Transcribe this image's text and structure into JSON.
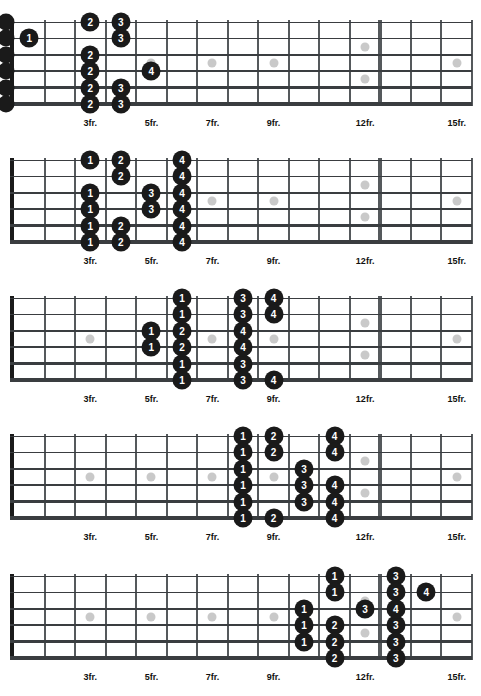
{
  "page": {
    "width": 481,
    "height": 696,
    "background": "#ffffff",
    "dot_color": "#1a1a1a",
    "dot_text_color": "#ffffff",
    "inlay_color": "#c9c9c9",
    "fret_color": "#55595c",
    "string_color": "#3a3d40",
    "nut_color": "#1a1a1a"
  },
  "fretboard": {
    "num_strings": 6,
    "num_frets": 15,
    "string_names_high_to_low": [
      "1",
      "2",
      "3",
      "4",
      "5",
      "6"
    ],
    "fret_marker_labels": [
      {
        "fret": 3,
        "label": "3fr."
      },
      {
        "fret": 5,
        "label": "5fr."
      },
      {
        "fret": 7,
        "label": "7fr."
      },
      {
        "fret": 9,
        "label": "9fr."
      },
      {
        "fret": 12,
        "label": "12fr."
      },
      {
        "fret": 15,
        "label": "15fr."
      }
    ],
    "single_inlay_frets": [
      3,
      5,
      7,
      9,
      15
    ],
    "double_inlay_frets": [
      12
    ],
    "single_inlay_string_gap": 3,
    "double_inlay_string_gaps": [
      2,
      4
    ]
  },
  "diagrams": [
    {
      "name": "position-1",
      "index": 1,
      "show_open_strings": true,
      "open_strings": [
        {
          "string": 1
        },
        {
          "string": 2
        },
        {
          "string": 3
        },
        {
          "string": 4
        },
        {
          "string": 5
        },
        {
          "string": 6
        }
      ],
      "notes": [
        {
          "string": 2,
          "fret": 1,
          "finger": "1"
        },
        {
          "string": 1,
          "fret": 3,
          "finger": "2"
        },
        {
          "string": 3,
          "fret": 3,
          "finger": "2"
        },
        {
          "string": 4,
          "fret": 3,
          "finger": "2"
        },
        {
          "string": 5,
          "fret": 3,
          "finger": "2"
        },
        {
          "string": 6,
          "fret": 3,
          "finger": "2"
        },
        {
          "string": 1,
          "fret": 4,
          "finger": "3"
        },
        {
          "string": 2,
          "fret": 4,
          "finger": "3"
        },
        {
          "string": 5,
          "fret": 4,
          "finger": "3"
        },
        {
          "string": 6,
          "fret": 4,
          "finger": "3"
        },
        {
          "string": 4,
          "fret": 5,
          "finger": "4"
        }
      ]
    },
    {
      "name": "position-2",
      "index": 2,
      "show_open_strings": false,
      "open_strings": [],
      "notes": [
        {
          "string": 1,
          "fret": 3,
          "finger": "1"
        },
        {
          "string": 3,
          "fret": 3,
          "finger": "1"
        },
        {
          "string": 4,
          "fret": 3,
          "finger": "1"
        },
        {
          "string": 5,
          "fret": 3,
          "finger": "1"
        },
        {
          "string": 6,
          "fret": 3,
          "finger": "1"
        },
        {
          "string": 1,
          "fret": 4,
          "finger": "2"
        },
        {
          "string": 2,
          "fret": 4,
          "finger": "2"
        },
        {
          "string": 5,
          "fret": 4,
          "finger": "2"
        },
        {
          "string": 6,
          "fret": 4,
          "finger": "2"
        },
        {
          "string": 3,
          "fret": 5,
          "finger": "3"
        },
        {
          "string": 4,
          "fret": 5,
          "finger": "3"
        },
        {
          "string": 1,
          "fret": 6,
          "finger": "4"
        },
        {
          "string": 2,
          "fret": 6,
          "finger": "4"
        },
        {
          "string": 3,
          "fret": 6,
          "finger": "4"
        },
        {
          "string": 4,
          "fret": 6,
          "finger": "4"
        },
        {
          "string": 5,
          "fret": 6,
          "finger": "4"
        },
        {
          "string": 6,
          "fret": 6,
          "finger": "4"
        }
      ]
    },
    {
      "name": "position-3",
      "index": 3,
      "show_open_strings": false,
      "open_strings": [],
      "notes": [
        {
          "string": 3,
          "fret": 5,
          "finger": "1"
        },
        {
          "string": 4,
          "fret": 5,
          "finger": "1"
        },
        {
          "string": 1,
          "fret": 6,
          "finger": "1"
        },
        {
          "string": 2,
          "fret": 6,
          "finger": "1"
        },
        {
          "string": 5,
          "fret": 6,
          "finger": "1"
        },
        {
          "string": 6,
          "fret": 6,
          "finger": "1"
        },
        {
          "string": 3,
          "fret": 6,
          "finger": "2"
        },
        {
          "string": 4,
          "fret": 6,
          "finger": "2"
        },
        {
          "string": 1,
          "fret": 8,
          "finger": "3"
        },
        {
          "string": 2,
          "fret": 8,
          "finger": "3"
        },
        {
          "string": 5,
          "fret": 8,
          "finger": "3"
        },
        {
          "string": 6,
          "fret": 8,
          "finger": "3"
        },
        {
          "string": 3,
          "fret": 8,
          "finger": "4"
        },
        {
          "string": 4,
          "fret": 8,
          "finger": "4"
        },
        {
          "string": 1,
          "fret": 9,
          "finger": "4"
        },
        {
          "string": 2,
          "fret": 9,
          "finger": "4"
        },
        {
          "string": 6,
          "fret": 9,
          "finger": "4"
        }
      ]
    },
    {
      "name": "position-4",
      "index": 4,
      "show_open_strings": false,
      "open_strings": [],
      "notes": [
        {
          "string": 1,
          "fret": 8,
          "finger": "1"
        },
        {
          "string": 2,
          "fret": 8,
          "finger": "1"
        },
        {
          "string": 3,
          "fret": 8,
          "finger": "1"
        },
        {
          "string": 4,
          "fret": 8,
          "finger": "1"
        },
        {
          "string": 5,
          "fret": 8,
          "finger": "1"
        },
        {
          "string": 6,
          "fret": 8,
          "finger": "1"
        },
        {
          "string": 1,
          "fret": 9,
          "finger": "2"
        },
        {
          "string": 2,
          "fret": 9,
          "finger": "2"
        },
        {
          "string": 6,
          "fret": 9,
          "finger": "2"
        },
        {
          "string": 3,
          "fret": 10,
          "finger": "3"
        },
        {
          "string": 4,
          "fret": 10,
          "finger": "3"
        },
        {
          "string": 5,
          "fret": 10,
          "finger": "3"
        },
        {
          "string": 1,
          "fret": 11,
          "finger": "4"
        },
        {
          "string": 2,
          "fret": 11,
          "finger": "4"
        },
        {
          "string": 4,
          "fret": 11,
          "finger": "4"
        },
        {
          "string": 5,
          "fret": 11,
          "finger": "4"
        },
        {
          "string": 6,
          "fret": 11,
          "finger": "4"
        }
      ]
    },
    {
      "name": "position-5",
      "index": 5,
      "show_open_strings": false,
      "open_strings": [],
      "notes": [
        {
          "string": 3,
          "fret": 10,
          "finger": "1"
        },
        {
          "string": 4,
          "fret": 10,
          "finger": "1"
        },
        {
          "string": 5,
          "fret": 10,
          "finger": "1"
        },
        {
          "string": 1,
          "fret": 11,
          "finger": "1"
        },
        {
          "string": 2,
          "fret": 11,
          "finger": "1"
        },
        {
          "string": 4,
          "fret": 11,
          "finger": "2"
        },
        {
          "string": 5,
          "fret": 11,
          "finger": "2"
        },
        {
          "string": 6,
          "fret": 11,
          "finger": "2"
        },
        {
          "string": 3,
          "fret": 12,
          "finger": "3"
        },
        {
          "string": 1,
          "fret": 13,
          "finger": "3"
        },
        {
          "string": 2,
          "fret": 13,
          "finger": "3"
        },
        {
          "string": 4,
          "fret": 13,
          "finger": "3"
        },
        {
          "string": 5,
          "fret": 13,
          "finger": "3"
        },
        {
          "string": 6,
          "fret": 13,
          "finger": "3"
        },
        {
          "string": 3,
          "fret": 13,
          "finger": "4"
        },
        {
          "string": 2,
          "fret": 14,
          "finger": "4"
        }
      ]
    }
  ]
}
